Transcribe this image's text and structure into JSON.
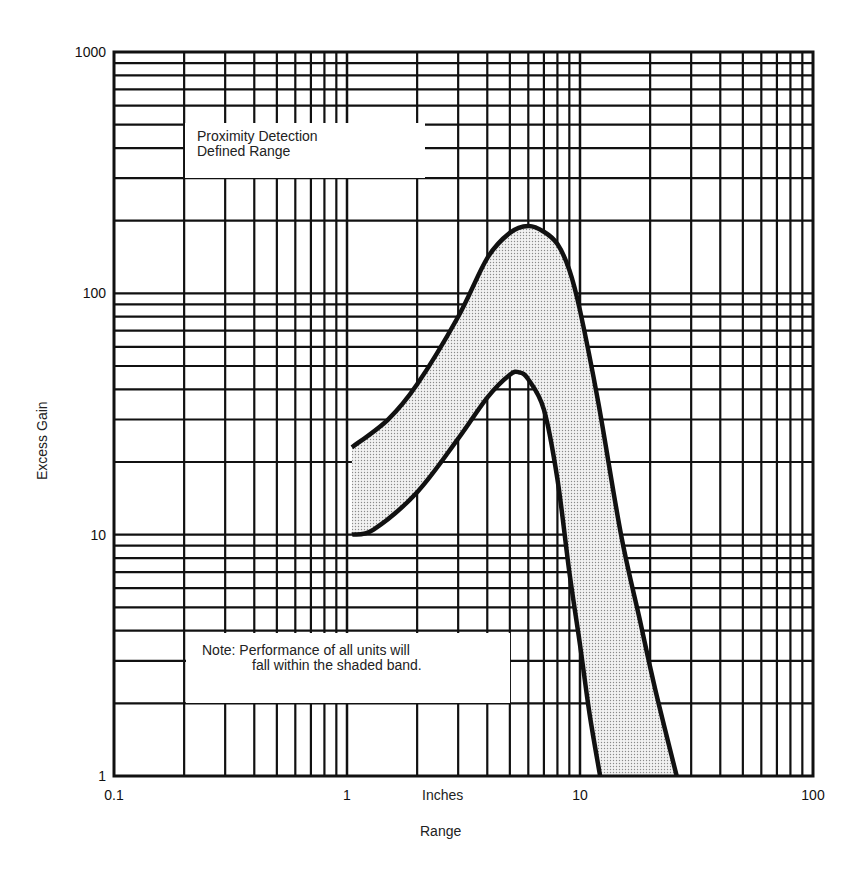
{
  "chart_data": {
    "type": "area",
    "title": "",
    "xlabel": "Range",
    "xunit_label": "Inches",
    "ylabel": "Excess Gain",
    "xscale": "log",
    "yscale": "log",
    "xlim": [
      0.1,
      100
    ],
    "ylim": [
      1,
      1000
    ],
    "x_ticks": [
      "0.1",
      "1",
      "10",
      "100"
    ],
    "y_ticks": [
      "1",
      "10",
      "100",
      "1000"
    ],
    "grid": true,
    "series": [
      {
        "name": "Upper bound",
        "points": [
          [
            1.05,
            23
          ],
          [
            1.5,
            30
          ],
          [
            2,
            42
          ],
          [
            3,
            80
          ],
          [
            4,
            140
          ],
          [
            5,
            178
          ],
          [
            6,
            190
          ],
          [
            7,
            180
          ],
          [
            8,
            160
          ],
          [
            9,
            125
          ],
          [
            10,
            85
          ],
          [
            12,
            35
          ],
          [
            15,
            10
          ],
          [
            18,
            4.5
          ],
          [
            21,
            2.3
          ],
          [
            26,
            1
          ]
        ]
      },
      {
        "name": "Lower bound",
        "points": [
          [
            1.05,
            10
          ],
          [
            1.3,
            10.5
          ],
          [
            2,
            15
          ],
          [
            3,
            25
          ],
          [
            4,
            37
          ],
          [
            5,
            46
          ],
          [
            5.5,
            47
          ],
          [
            6,
            44
          ],
          [
            7,
            33
          ],
          [
            8,
            17
          ],
          [
            9,
            7
          ],
          [
            10,
            3.5
          ],
          [
            11,
            1.8
          ],
          [
            12.2,
            1
          ]
        ]
      }
    ],
    "shaded_band": "between Upper bound and Lower bound",
    "annotations": [
      {
        "id": "legend_box",
        "lines": [
          "Proximity Detection",
          "Defined Range"
        ]
      },
      {
        "id": "note_box",
        "lines": [
          "Note:  Performance of all units will",
          "fall within the shaded band."
        ]
      }
    ]
  }
}
